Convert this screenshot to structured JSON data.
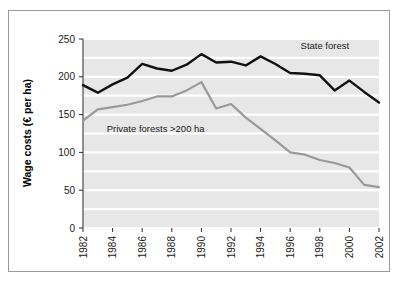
{
  "chart_data": {
    "type": "line",
    "title": "",
    "xlabel": "",
    "ylabel": "Wage costs (€ per ha)",
    "ylim": [
      0,
      250
    ],
    "yticks": [
      0,
      50,
      100,
      150,
      200,
      250
    ],
    "ytick_labels": [
      "0",
      "50",
      "100",
      "150",
      "200",
      "250"
    ],
    "xlim": [
      1982,
      2002
    ],
    "x": [
      1982,
      1983,
      1984,
      1985,
      1986,
      1987,
      1988,
      1989,
      1990,
      1991,
      1992,
      1993,
      1994,
      1995,
      1996,
      1997,
      1998,
      1999,
      2000,
      2001,
      2002
    ],
    "xtick_labels": [
      "1982",
      "1984",
      "1986",
      "1988",
      "1990",
      "1992",
      "1994",
      "1996",
      "1998",
      "2000",
      "2002"
    ],
    "xticks": [
      1982,
      1984,
      1986,
      1988,
      1990,
      1992,
      1994,
      1996,
      1998,
      2000,
      2002
    ],
    "xtick_rotation": 90,
    "grid": "horizontal-white-on-gray",
    "plot_background": "#e7e7e7",
    "gridline_color": "#ffffff",
    "legend": "inline-labels",
    "series": [
      {
        "name": "State forest",
        "color": "#111111",
        "label_text": "State forest",
        "values": [
          189,
          179,
          190,
          199,
          217,
          211,
          208,
          216,
          230,
          219,
          220,
          215,
          227,
          217,
          205,
          204,
          202,
          182,
          195,
          180,
          166
        ]
      },
      {
        "name": "Private forests >200 ha",
        "color": "#999999",
        "label_text": "Private forests >200 ha",
        "values": [
          142,
          157,
          160,
          163,
          168,
          174,
          174,
          182,
          193,
          158,
          164,
          146,
          131,
          116,
          100,
          97,
          90,
          86,
          80,
          57,
          54
        ]
      }
    ],
    "annotations": [
      {
        "name": "state-forest-label",
        "text": "State forest",
        "x": 1996.7,
        "y": 237
      },
      {
        "name": "private-forest-label",
        "text": "Private forests >200 ha",
        "x": 1983.6,
        "y": 127
      }
    ]
  },
  "figure": {
    "border_color": "#9a9a9a",
    "background": "#ffffff"
  }
}
